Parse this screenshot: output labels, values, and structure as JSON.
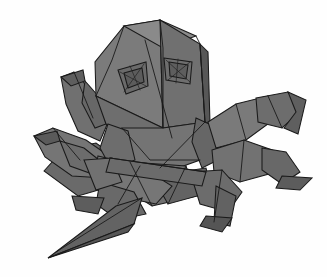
{
  "artwork": {
    "title": "Origami crab",
    "subject": "folded paper crab figure",
    "medium": "paper folding illustration",
    "view": "three-quarter front view",
    "background_color": "#fefefe",
    "outline_color": "#1a1a1a",
    "canvas": {
      "width": 327,
      "height": 277
    }
  },
  "palette": {
    "paper_light": "#8c8c8c",
    "paper_mid": "#7d7d7d",
    "paper_base": "#757575",
    "paper_shade": "#6a6a6a",
    "paper_dark": "#5e5e5e",
    "paper_darker": "#525252",
    "paper_deep": "#474747",
    "paper_highlight": "#9a9a9a",
    "ink": "#1a1a1a"
  },
  "parts": [
    {
      "id": "left-rear-leg-upper",
      "name": "left rear leg upper segment",
      "fill": "#6a6a6a",
      "points": "44,171 63,150 96,143 120,160 112,186 78,196"
    },
    {
      "id": "left-claw-upper-arm",
      "name": "upper left claw arm",
      "fill": "#707070",
      "points": "61,77 74,72 93,93 109,120 100,141 78,131 66,104"
    },
    {
      "id": "left-claw-upper-hook",
      "name": "upper left claw hook tip",
      "fill": "#5e5e5e",
      "points": "61,77 83,70 85,81 71,86"
    },
    {
      "id": "left-claw-upper-inner",
      "name": "upper left claw inner jaw",
      "fill": "#676767",
      "points": "85,81 100,98 106,124 95,128 82,103"
    },
    {
      "id": "left-claw-lower-arm",
      "name": "lower left claw arm",
      "fill": "#757575",
      "points": "34,136 53,128 86,140 112,158 104,178 72,176 45,157"
    },
    {
      "id": "left-claw-lower-hook",
      "name": "lower left claw hook tip",
      "fill": "#5a5a5a",
      "points": "34,136 57,131 60,141 46,145"
    },
    {
      "id": "left-claw-lower-inner",
      "name": "lower left claw inner jaw",
      "fill": "#6c6c6c",
      "points": "60,141 84,148 104,164 98,176 70,166"
    },
    {
      "id": "head-left-panel",
      "name": "head left facet",
      "fill": "#7b7b7b",
      "points": "124,26 160,20 163,128 96,96 95,62"
    },
    {
      "id": "head-top-ridge",
      "name": "head top ridge facet",
      "fill": "#8a8a8a",
      "points": "124,26 160,20 196,36 163,48"
    },
    {
      "id": "head-right-panel",
      "name": "head right facet",
      "fill": "#707070",
      "points": "160,20 200,44 205,122 163,128"
    },
    {
      "id": "head-right-edge",
      "name": "head right edge band",
      "fill": "#575757",
      "points": "200,44 208,52 210,124 205,122"
    },
    {
      "id": "head-lower-left-bevel",
      "name": "head lower left bevel",
      "fill": "#6e6e6e",
      "points": "96,96 163,128 150,146 106,124"
    },
    {
      "id": "eye-left-socket",
      "name": "left eye socket",
      "fill": "#6a6a6a",
      "points": "118,70 146,62 148,86 126,94"
    },
    {
      "id": "eye-left-pleat",
      "name": "left eye pleat",
      "fill": "#5c5c5c",
      "points": "124,73 142,68 144,82 128,88"
    },
    {
      "id": "eye-right-socket",
      "name": "right eye socket",
      "fill": "#6e6e6e",
      "points": "164,58 192,62 190,84 166,80"
    },
    {
      "id": "eye-right-pleat",
      "name": "right eye pleat",
      "fill": "#5e5e5e",
      "points": "169,62 188,65 186,79 170,76"
    },
    {
      "id": "thorax-center",
      "name": "central thorax facet",
      "fill": "#747474",
      "points": "122,128 163,128 205,122 200,160 150,178 118,158"
    },
    {
      "id": "thorax-left-flap",
      "name": "thorax left flap",
      "fill": "#6d6d6d",
      "points": "108,124 128,131 135,160 112,170 100,148"
    },
    {
      "id": "thorax-right-flap",
      "name": "thorax right flap",
      "fill": "#666666",
      "points": "196,118 218,128 222,158 202,168 192,142"
    },
    {
      "id": "abdomen-panel",
      "name": "abdomen under panel",
      "fill": "#6f6f6f",
      "points": "130,162 186,166 196,196 152,206 124,188"
    },
    {
      "id": "belly-fold",
      "name": "belly fold facet",
      "fill": "#636363",
      "points": "152,176 206,168 212,192 168,204"
    },
    {
      "id": "right-upper-leg-thigh",
      "name": "right upper leg thigh",
      "fill": "#7a7a7a",
      "points": "208,122 236,104 268,96 276,118 246,140 216,148"
    },
    {
      "id": "right-upper-leg-shin",
      "name": "right upper leg shin",
      "fill": "#6d6d6d",
      "points": "256,98 288,92 302,110 282,128 258,122"
    },
    {
      "id": "right-upper-leg-claw",
      "name": "right upper leg claw tip",
      "fill": "#5f5f5f",
      "points": "288,92 306,100 298,134 284,128 296,112"
    },
    {
      "id": "right-mid-leg-thigh",
      "name": "right middle leg thigh",
      "fill": "#727272",
      "points": "212,150 244,140 272,150 276,172 240,182 214,172"
    },
    {
      "id": "right-mid-leg-shin",
      "name": "right middle leg shin",
      "fill": "#686868",
      "points": "262,148 286,152 300,172 282,184 262,170"
    },
    {
      "id": "right-mid-leg-foot",
      "name": "right middle leg foot",
      "fill": "#5c5c5c",
      "points": "282,176 312,178 300,190 276,188"
    },
    {
      "id": "right-lower-leg-thigh",
      "name": "right lower leg thigh",
      "fill": "#6c6c6c",
      "points": "190,172 222,170 242,192 228,212 200,204"
    },
    {
      "id": "right-lower-leg-shin",
      "name": "right lower leg shin",
      "fill": "#626262",
      "points": "216,186 236,196 230,226 214,222"
    },
    {
      "id": "right-lower-leg-foot",
      "name": "right lower leg foot",
      "fill": "#555555",
      "points": "206,216 232,218 222,232 200,226"
    },
    {
      "id": "left-front-leg-upper",
      "name": "left front leg upper segment",
      "fill": "#767676",
      "points": "98,156 140,166 172,186 156,204 116,196 94,176"
    },
    {
      "id": "left-front-leg-lower",
      "name": "left front leg lower segment",
      "fill": "#696969",
      "points": "100,182 134,192 146,214 118,220 96,204"
    },
    {
      "id": "left-long-spike",
      "name": "long left lower spike leg",
      "fill": "#636363",
      "points": "116,206 142,198 134,224 48,258"
    },
    {
      "id": "left-long-spike-under",
      "name": "long left spike underside",
      "fill": "#565656",
      "points": "48,258 134,224 128,232"
    },
    {
      "id": "left-small-foot",
      "name": "left small foot",
      "fill": "#5d5d5d",
      "points": "72,196 104,198 98,214 76,210"
    },
    {
      "id": "left-knee-wedge",
      "name": "left knee wedge",
      "fill": "#717171",
      "points": "84,160 112,158 122,182 96,190"
    },
    {
      "id": "center-cross-band",
      "name": "central crossing band",
      "fill": "#6b6b6b",
      "points": "110,158 206,172 202,186 106,172"
    }
  ],
  "creases": [
    {
      "id": "head-center-ridge",
      "name": "head center ridge crease",
      "d": "M 145,40 L 172,138"
    },
    {
      "id": "head-left-fold",
      "name": "head left fold",
      "d": "M 124,26 L 112,60 L 96,96"
    },
    {
      "id": "head-top-fold",
      "name": "head top fold",
      "d": "M 160,20 L 163,48 L 163,128"
    },
    {
      "id": "head-right-fold",
      "name": "head right fold",
      "d": "M 196,36 L 200,44 L 205,122"
    },
    {
      "id": "eye-left-cross-a",
      "name": "left eye cross crease a",
      "d": "M 120,72 L 146,86"
    },
    {
      "id": "eye-left-cross-b",
      "name": "left eye cross crease b",
      "d": "M 144,64 L 124,92"
    },
    {
      "id": "eye-left-cross-c",
      "name": "left eye cross crease c",
      "d": "M 130,66 L 140,90"
    },
    {
      "id": "eye-right-cross-a",
      "name": "right eye cross crease a",
      "d": "M 166,60 L 190,82"
    },
    {
      "id": "eye-right-cross-b",
      "name": "right eye cross crease b",
      "d": "M 190,62 L 168,80"
    },
    {
      "id": "eye-right-cross-c",
      "name": "right eye cross crease c",
      "d": "M 178,59 L 176,83"
    },
    {
      "id": "thorax-seam",
      "name": "thorax seam crease",
      "d": "M 122,128 L 150,160 L 200,160"
    },
    {
      "id": "thorax-diagonal",
      "name": "thorax diagonal crease",
      "d": "M 205,122 L 160,168"
    },
    {
      "id": "abdomen-seam",
      "name": "abdomen seam crease",
      "d": "M 130,162 L 152,206"
    },
    {
      "id": "belly-seam",
      "name": "belly seam crease",
      "d": "M 186,166 L 168,204"
    },
    {
      "id": "right-thigh-crease",
      "name": "right thigh crease",
      "d": "M 236,104 L 246,140"
    },
    {
      "id": "right-shin-crease",
      "name": "right shin crease",
      "d": "M 268,96 L 282,128"
    },
    {
      "id": "right-mid-crease",
      "name": "right middle leg crease",
      "d": "M 244,140 L 240,182"
    },
    {
      "id": "right-lower-crease",
      "name": "right lower leg crease",
      "d": "M 222,170 L 214,222"
    },
    {
      "id": "left-claw-crease-a",
      "name": "left upper claw crease",
      "d": "M 74,72 L 93,118"
    },
    {
      "id": "left-claw-crease-b",
      "name": "left lower claw crease",
      "d": "M 53,128 L 80,160"
    },
    {
      "id": "left-front-crease",
      "name": "left front leg crease",
      "d": "M 140,166 L 118,204"
    },
    {
      "id": "left-spike-crease",
      "name": "left spike crease",
      "d": "M 142,198 L 56,252"
    },
    {
      "id": "cross-band-crease",
      "name": "crossing band crease",
      "d": "M 110,158 L 206,172"
    }
  ]
}
